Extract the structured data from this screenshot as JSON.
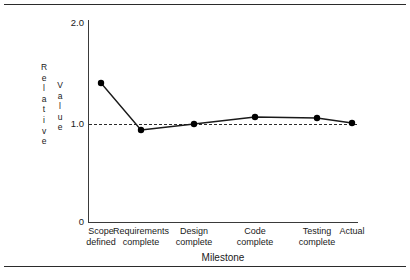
{
  "figure": {
    "background": "#ffffff",
    "line_color": "#1a1a1a",
    "marker_color": "#000000",
    "axis_color": "#3a3a3a",
    "rule_color": "#2b2b2b"
  },
  "chart_data": {
    "type": "line",
    "title": "",
    "xlabel": "Milestone",
    "ylabel": "Relative Value",
    "ylabel_col1": "Relative",
    "ylabel_col2": "Value",
    "categories": [
      "Scope\ndefined",
      "Requirements\ncomplete",
      "Design\ncomplete",
      "Code\ncomplete",
      "Testing\ncomplete",
      "Actual"
    ],
    "values": [
      1.39,
      0.92,
      0.98,
      1.05,
      1.04,
      0.99
    ],
    "ylim": [
      0,
      2.0
    ],
    "ytick_labels": [
      "2.0",
      "1.0",
      "0"
    ],
    "ytick_values": [
      2.0,
      1.0,
      0
    ],
    "grid": false,
    "legend": "none",
    "reference_line": {
      "value": 1.0,
      "style": "dashed"
    },
    "markers": "filled-circle"
  }
}
